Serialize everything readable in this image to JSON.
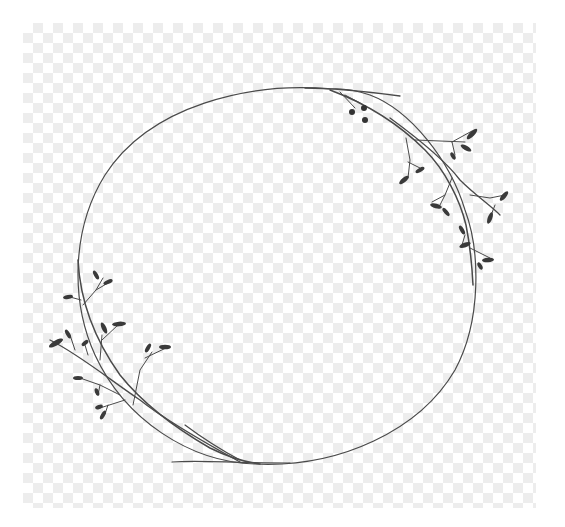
{
  "image": {
    "width": 565,
    "height": 527,
    "description": "Botanical wreath line art on transparent checkerboard background",
    "background": {
      "type": "transparency-checkerboard",
      "area": {
        "x": 23,
        "y": 23,
        "width": 513,
        "height": 485
      },
      "cell_size": 10,
      "colors": [
        "#ffffff",
        "#ececec"
      ]
    },
    "wreath": {
      "shape": "circle",
      "center": {
        "x": 277,
        "y": 276
      },
      "radius_x": 198,
      "radius_y": 189,
      "stroke_color": "#4a4a4a",
      "branches": [
        {
          "name": "top-right-branch",
          "position": "upper right arc",
          "leaf_color": "#3a3a3a"
        },
        {
          "name": "bottom-left-branch",
          "position": "lower left arc",
          "leaf_color": "#3a3a3a"
        }
      ]
    }
  }
}
